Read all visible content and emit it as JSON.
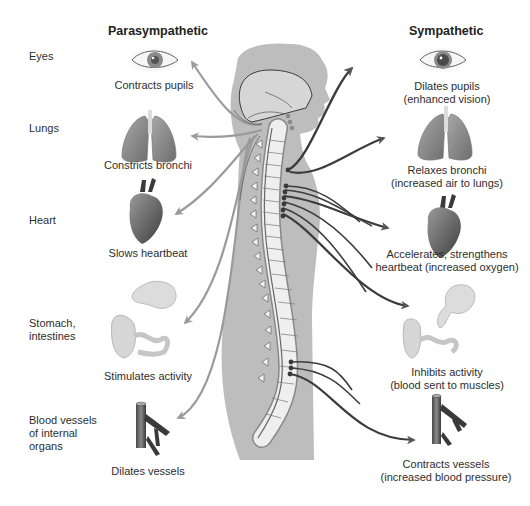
{
  "headers": {
    "parasympathetic": "Parasympathetic",
    "sympathetic": "Sympathetic"
  },
  "organs": [
    {
      "id": "eyes",
      "label": [
        "Eyes"
      ],
      "icon": "eye-icon",
      "parasympathetic": [
        "Contracts pupils"
      ],
      "sympathetic": [
        "Dilates pupils",
        "(enhanced vision)"
      ]
    },
    {
      "id": "lungs",
      "label": [
        "Lungs"
      ],
      "icon": "lungs-icon",
      "parasympathetic": [
        "Constricts bronchi"
      ],
      "sympathetic": [
        "Relaxes bronchi",
        "(increased air to lungs)"
      ]
    },
    {
      "id": "heart",
      "label": [
        "Heart"
      ],
      "icon": "heart-icon",
      "parasympathetic": [
        "Slows heartbeat"
      ],
      "sympathetic": [
        "Accelerates, strengthens",
        "heartbeat (increased oxygen)"
      ]
    },
    {
      "id": "stomach",
      "label": [
        "Stomach,",
        "intestines"
      ],
      "icon": "stomach-intestines-icon",
      "parasympathetic": [
        "Stimulates activity"
      ],
      "sympathetic": [
        "Inhibits activity",
        "(blood sent to muscles)"
      ]
    },
    {
      "id": "vessels",
      "label": [
        "Blood vessels",
        "of internal",
        "organs"
      ],
      "icon": "blood-vessel-icon",
      "parasympathetic": [
        "Dilates vessels"
      ],
      "sympathetic": [
        "Contracts vessels",
        "(increased blood pressure)"
      ]
    }
  ],
  "colors": {
    "body": "#bdbdbd",
    "spine": "#eeeeee",
    "nerve": "#4a4a4a",
    "para_arrow": "#9a9a9a",
    "symp_arrow": "#3c3c3c",
    "organ": "#8e8e8e"
  }
}
